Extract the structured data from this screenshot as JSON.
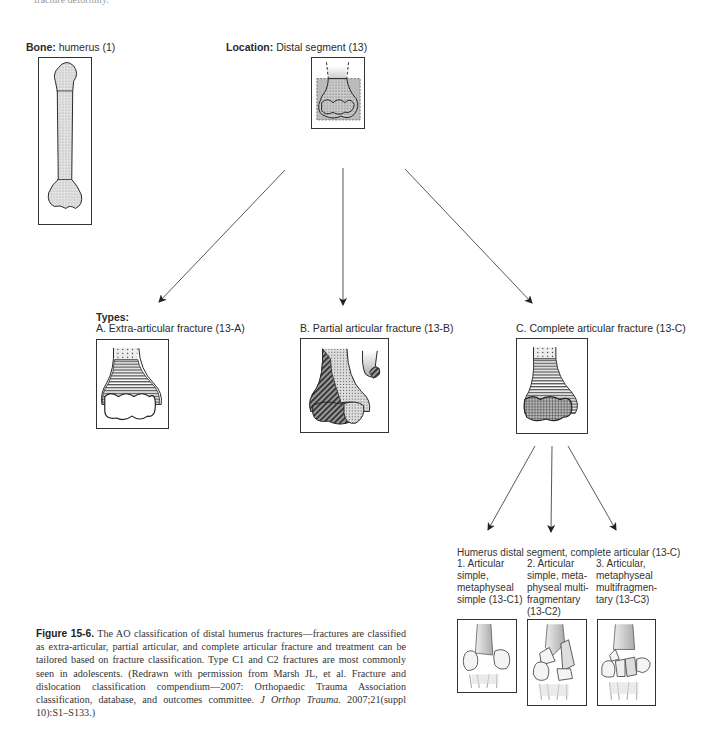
{
  "page": {
    "top_cut_text": "fracture deformity."
  },
  "bone": {
    "label_bold": "Bone:",
    "label_text": " humerus (1)"
  },
  "location": {
    "label_bold": "Location:",
    "label_text": " Distal segment (13)"
  },
  "types": {
    "heading": "Types:",
    "items": [
      {
        "label": "A. Extra-articular fracture (13-A)"
      },
      {
        "label": "B. Partial articular fracture (13-B)"
      },
      {
        "label": "C. Complete articular fracture (13-C)"
      }
    ]
  },
  "subtypes": {
    "heading": "Humerus distal segment, complete articular (13-C)",
    "items": [
      {
        "lines": [
          "1. Articular",
          "simple,",
          "metaphyseal",
          "simple (13-C1)"
        ]
      },
      {
        "lines": [
          "2. Articular",
          "simple, meta-",
          "physeal multi-",
          "fragmentary",
          "(13-C2)"
        ]
      },
      {
        "lines": [
          "3. Articular,",
          "metaphyseal",
          "multifragmen-",
          "tary (13-C3)"
        ]
      }
    ]
  },
  "caption": {
    "figure_label": "Figure 15-6.",
    "text": " The AO classification of distal humerus fractures—fractures are classified as extra-articular, partial articular, and complete articular fracture and treatment can be tailored based on fracture classification. Type C1 and C2 fractures are most commonly seen in adolescents. (Redrawn with permission from Marsh JL, et al. Fracture and dislocation classification compendium—2007: Orthopaedic Trauma Association classification, database, and outcomes committee. ",
    "journal": "J Orthop Trauma.",
    "citation": " 2007;21(suppl 10):S1–S133.)"
  },
  "colors": {
    "line": "#333333",
    "bone_fill": "#d9d9d9",
    "shade": "#bfbfbf"
  }
}
